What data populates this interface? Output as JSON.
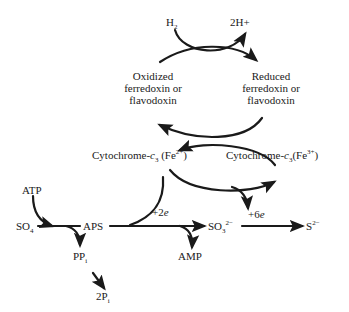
{
  "diagram": {
    "nodes": {
      "h2": {
        "label": "H",
        "sub": "2"
      },
      "two_h_plus": {
        "label": "2H+"
      },
      "oxidized_fd": {
        "line1": "Oxidized",
        "line2": "ferredoxin or",
        "line3": "flavodoxin"
      },
      "reduced_fd": {
        "line1": "Reduced",
        "line2": "ferredoxin or",
        "line3": "flavodoxin"
      },
      "cyt_fe2": {
        "prefix": "Cytochrome-",
        "c": "c",
        "sub": "3",
        "fe": " (Fe",
        "sup": "2+",
        "close": ")"
      },
      "cyt_fe3": {
        "prefix": "Cytochrome-",
        "c": "c",
        "sub": "3",
        "fe": "(Fe",
        "sup": "3+",
        "close": ")"
      },
      "atp": {
        "label": "ATP"
      },
      "so4": {
        "label": "SO",
        "sub": "4"
      },
      "aps": {
        "label": "APS"
      },
      "pp_i": {
        "label": "PP",
        "sub": "i"
      },
      "two_p_i": {
        "label": "2P",
        "sub": "i"
      },
      "amp": {
        "label": "AMP"
      },
      "so3": {
        "label": "SO",
        "sub": "3",
        "sup": "2−"
      },
      "s2": {
        "label": "S",
        "sup": "2−"
      }
    },
    "edge_labels": {
      "plus_2e": {
        "sign": "+2",
        "e": "e"
      },
      "plus_6e": {
        "sign": "+6",
        "e": "e"
      }
    },
    "colors": {
      "ink": "#1a1a1a",
      "background": "#ffffff"
    }
  }
}
